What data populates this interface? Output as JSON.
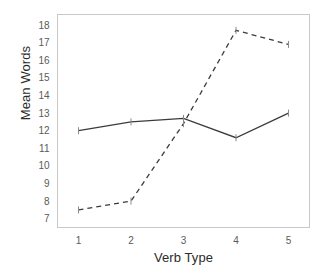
{
  "chart_data": {
    "type": "line",
    "title": "",
    "xlabel": "Verb Type",
    "ylabel": "Mean Words",
    "categories": [
      "1",
      "2",
      "3",
      "4",
      "5"
    ],
    "x": [
      1,
      2,
      3,
      4,
      5
    ],
    "xlim": [
      0.6,
      5.4
    ],
    "ylim": [
      6.5,
      18.6
    ],
    "yticks": [
      7,
      8,
      9,
      10,
      11,
      12,
      13,
      14,
      15,
      16,
      17,
      18
    ],
    "ytick_labels": [
      "7",
      "8",
      "9",
      "10",
      "11",
      "12",
      "13",
      "14",
      "15",
      "16",
      "17",
      "18"
    ],
    "xticks": [
      1,
      2,
      3,
      4,
      5
    ],
    "xtick_labels": [
      "1",
      "2",
      "3",
      "4",
      "5"
    ],
    "grid": false,
    "legend": "none",
    "series": [
      {
        "name": "solid-series",
        "style": "solid",
        "color": "#3b3b3b",
        "values": [
          12.0,
          12.5,
          12.7,
          11.6,
          13.0
        ]
      },
      {
        "name": "dashed-series",
        "style": "dashed",
        "color": "#3b3b3b",
        "values": [
          7.5,
          8.0,
          12.4,
          17.7,
          16.9
        ]
      }
    ]
  },
  "axes": {
    "y_title": "Mean Words",
    "x_title": "Verb Type"
  }
}
